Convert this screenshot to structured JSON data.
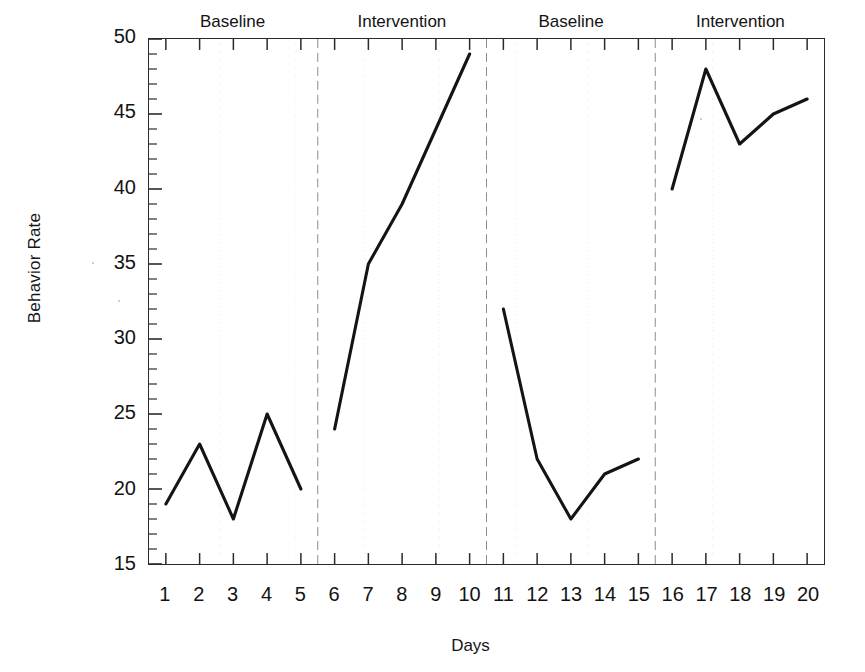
{
  "chart_data": {
    "type": "line",
    "title": "",
    "xlabel": "Days",
    "ylabel": "Behavior Rate",
    "xlim": [
      0.5,
      20.5
    ],
    "ylim": [
      15,
      50
    ],
    "grid": false,
    "legend": "none",
    "y_ticks": [
      15,
      20,
      25,
      30,
      35,
      40,
      45,
      50
    ],
    "y_minor_tick_step": 1,
    "x_ticks": [
      1,
      2,
      3,
      4,
      5,
      6,
      7,
      8,
      9,
      10,
      11,
      12,
      13,
      14,
      15,
      16,
      17,
      18,
      19,
      20
    ],
    "x": [
      1,
      2,
      3,
      4,
      5,
      6,
      7,
      8,
      9,
      10,
      11,
      12,
      13,
      14,
      15,
      16,
      17,
      18,
      19,
      20
    ],
    "series": [
      {
        "name": "Behavior Rate",
        "values": [
          19,
          23,
          18,
          25,
          20,
          24,
          35,
          39,
          44,
          49,
          32,
          22,
          18,
          21,
          22,
          40,
          48,
          43,
          45,
          46
        ],
        "color": "#141414",
        "breaks_after_x": [
          5,
          10,
          15
        ]
      }
    ],
    "phases": [
      {
        "label": "Baseline",
        "x_start": 1,
        "x_end": 5,
        "center_x": 3.0
      },
      {
        "label": "Intervention",
        "x_start": 6,
        "x_end": 10,
        "center_x": 8.0
      },
      {
        "label": "Baseline",
        "x_start": 11,
        "x_end": 15,
        "center_x": 13.0
      },
      {
        "label": "Intervention",
        "x_start": 16,
        "x_end": 20,
        "center_x": 18.0
      }
    ],
    "phase_dividers_x": [
      5.5,
      10.5,
      15.5
    ],
    "phase_divider_style": "dashed-thin",
    "phase_divider_color": "#8c8c8c",
    "axis_color": "#2a2a2a",
    "background": "#ffffff"
  },
  "axes": {
    "y_title": "Behavior Rate",
    "x_title": "Days",
    "y_tick_labels": [
      "50",
      "45",
      "40",
      "35",
      "30",
      "25",
      "20",
      "15"
    ],
    "x_tick_labels": [
      "1",
      "2",
      "3",
      "4",
      "5",
      "6",
      "7",
      "8",
      "9",
      "10",
      "11",
      "12",
      "13",
      "14",
      "15",
      "16",
      "17",
      "18",
      "19",
      "20"
    ]
  },
  "phase_labels": [
    "Baseline",
    "Intervention",
    "Baseline",
    "Intervention"
  ]
}
